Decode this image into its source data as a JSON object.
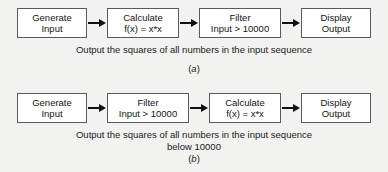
{
  "figure": {
    "background_color": "#f2f2f0",
    "box_border_color": "#5b5b5b",
    "box_fill_color": "#ffffff",
    "arrow_color": "#111111",
    "text_color": "#141414"
  },
  "diagrams": [
    {
      "id": "a",
      "label_open": "(",
      "label_letter": "a",
      "label_close": ")",
      "caption_line1": "Output the squares of all numbers in the input sequence",
      "caption_line2": "",
      "nodes": [
        {
          "line1": "Generate",
          "line2": "Input"
        },
        {
          "line1": "Calculate",
          "line2": "f(x) = x*x"
        },
        {
          "line1": "Filter",
          "line2": "Input > 10000"
        },
        {
          "line1": "Display",
          "line2": "Output"
        }
      ]
    },
    {
      "id": "b",
      "label_open": "(",
      "label_letter": "b",
      "label_close": ")",
      "caption_line1": "Output the squares of all numbers in the input sequence",
      "caption_line2": "below 10000",
      "nodes": [
        {
          "line1": "Generate",
          "line2": "Input"
        },
        {
          "line1": "Filter",
          "line2": "Input > 10000"
        },
        {
          "line1": "Calculate",
          "line2": "f(x) = x*x"
        },
        {
          "line1": "Display",
          "line2": "Output"
        }
      ]
    }
  ]
}
